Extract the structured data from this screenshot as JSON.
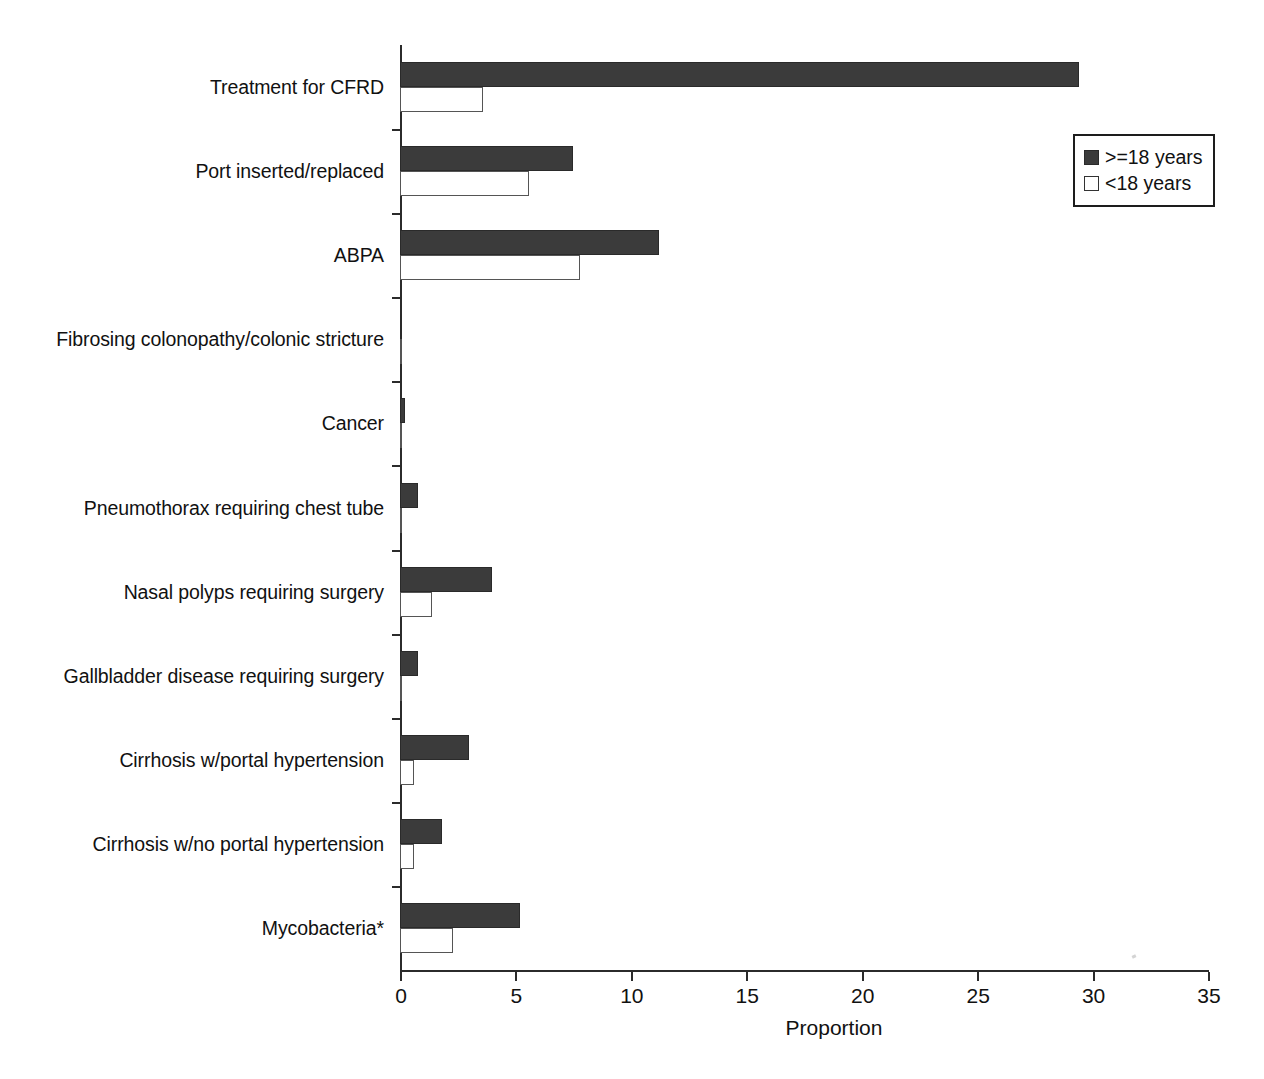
{
  "chart_data": {
    "type": "bar",
    "orientation": "horizontal",
    "title": "",
    "xlabel": "Proportion",
    "ylabel": "",
    "xlim": [
      0,
      35
    ],
    "xticks": [
      0,
      5,
      10,
      15,
      20,
      25,
      30,
      35
    ],
    "xtick_labels": [
      "0",
      "5",
      "10",
      "15",
      "20",
      "25",
      "30",
      "35"
    ],
    "grid": false,
    "legend_position": "top-right",
    "categories": [
      "Treatment for CFRD",
      "Port inserted/replaced",
      "ABPA",
      "Fibrosing colonopathy/colonic stricture",
      "Cancer",
      "Pneumothorax requiring chest tube",
      "Nasal polyps requiring surgery",
      "Gallbladder disease requiring surgery",
      "Cirrhosis w/portal hypertension",
      "Cirrhosis w/no portal hypertension",
      "Mycobacteria*"
    ],
    "series": [
      {
        "name": ">=18 years",
        "color": "#3b3b3b",
        "fill": "solid",
        "values": [
          29.4,
          7.5,
          11.2,
          0.1,
          0.2,
          0.8,
          4.0,
          0.8,
          3.0,
          1.8,
          5.2
        ]
      },
      {
        "name": "<18 years",
        "color": "#ffffff",
        "fill": "open",
        "values": [
          3.6,
          5.6,
          7.8,
          0.1,
          0.1,
          0.1,
          1.4,
          0.1,
          0.6,
          0.6,
          2.3
        ]
      }
    ]
  },
  "legend": {
    "items": [
      {
        "label": ">=18 years",
        "swatch": "filled-dark-square"
      },
      {
        "label": "<18 years",
        "swatch": "open-white-square"
      }
    ]
  },
  "axis": {
    "x_title": "Proportion"
  },
  "colors": {
    "bar_adult": "#3b3b3b",
    "bar_child": "#ffffff",
    "axis": "#2b2b2b",
    "text": "#111111"
  }
}
